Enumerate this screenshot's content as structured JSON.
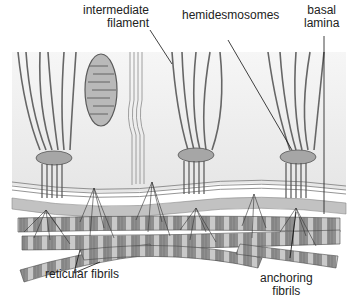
{
  "figure": {
    "labels": {
      "intermediate_filament": [
        "intermediate",
        "filament"
      ],
      "hemidesmosomes": "hemidesmosomes",
      "basal_lamina": [
        "basal",
        "lamina"
      ],
      "reticular_fibrils": "reticular fibrils",
      "anchoring_fibrils": [
        "anchoring",
        "fibrils"
      ]
    },
    "colors": {
      "cell_bg": "#ececec",
      "filament": "#6b6b6b",
      "lamina": "#bdbdbd",
      "fibril": "#8c8c8c",
      "fibril_band": "#c8c8c8",
      "plaque": "#a8a8a8",
      "leader": "#111111"
    },
    "structures": [
      "epithelial cell",
      "mitochondrion",
      "cell junction",
      "hemidesmosome",
      "basal lamina",
      "collagen fibrils"
    ]
  }
}
